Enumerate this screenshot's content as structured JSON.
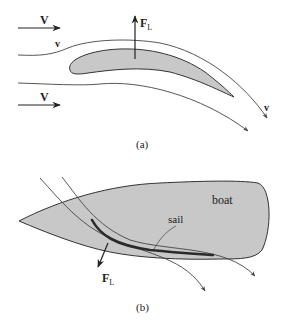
{
  "figure_a": {
    "caption": "(a)",
    "free_stream_velocity_top": "V",
    "free_stream_velocity_bottom": "V",
    "local_velocity_upper": "v",
    "local_velocity_trailing": "v",
    "lift_force": "F",
    "lift_force_subscript": "L",
    "object": "airfoil"
  },
  "figure_b": {
    "caption": "(b)",
    "boat_label": "boat",
    "sail_label": "sail",
    "lift_force": "F",
    "lift_force_subscript": "L"
  },
  "colors": {
    "fill_gray": "#c8c8c8",
    "line": "#333333",
    "sail": "#2a2a2a",
    "background": "#ffffff"
  }
}
